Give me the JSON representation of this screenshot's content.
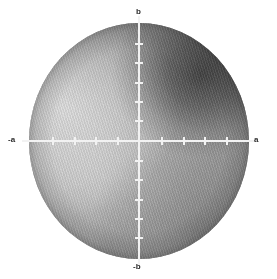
{
  "figure": {
    "kind": "grayscale-circular-intensity-map",
    "background_color": "#ffffff",
    "axis_color": "#f2f2f2",
    "label_color": "#2b2b2b"
  },
  "axes": {
    "horizontal": {
      "name": "a-axis",
      "label_positive": "a",
      "label_negative": "-a",
      "tick_count_per_side": 5
    },
    "vertical": {
      "name": "b-axis",
      "label_positive": "b",
      "label_negative": "-b",
      "tick_count_per_side": 6
    }
  },
  "chart_data": {
    "type": "heatmap",
    "title": "",
    "xlabel": "a",
    "ylabel": "b",
    "xlim": [
      -1,
      1
    ],
    "ylim": [
      -1,
      1
    ],
    "grid": false,
    "legend": null,
    "aperture": "circular",
    "colormap": "grayscale",
    "value_range_gray": [
      "#2a2a2a",
      "#e2e2e2"
    ],
    "x_ticks": [
      -1.0,
      -0.8,
      -0.6,
      -0.4,
      -0.2,
      0.2,
      0.4,
      0.6,
      0.8,
      1.0
    ],
    "y_ticks": [
      -1.0,
      -0.833,
      -0.667,
      -0.5,
      -0.333,
      -0.167,
      0.167,
      0.333,
      0.5,
      0.667,
      0.833,
      1.0
    ],
    "x_tick_labels": [
      "-a",
      "",
      "",
      "",
      "",
      "",
      "",
      "",
      "",
      "a"
    ],
    "y_tick_labels": [
      "-b",
      "",
      "",
      "",
      "",
      "",
      "",
      "",
      "",
      "",
      "",
      "b"
    ],
    "annotations": [
      {
        "text": "a",
        "x": 1.0,
        "y": 0.0
      },
      {
        "text": "-a",
        "x": -1.0,
        "y": 0.0
      },
      {
        "text": "b",
        "x": 0.0,
        "y": 1.0
      },
      {
        "text": "-b",
        "x": 0.0,
        "y": -1.0
      }
    ],
    "features": [
      {
        "name": "bright-lobe",
        "center_x": -0.62,
        "center_y": 0.28,
        "relative_intensity": 0.92
      },
      {
        "name": "dark-lobe",
        "center_x": 0.56,
        "center_y": 0.6,
        "relative_intensity": 0.12
      },
      {
        "name": "dark-lobe-lower-right",
        "center_x": 0.52,
        "center_y": -0.76,
        "relative_intensity": 0.34
      },
      {
        "name": "dark-lobe-lower-left",
        "center_x": -0.28,
        "center_y": -0.92,
        "relative_intensity": 0.4
      }
    ],
    "texture": {
      "name": "diagonal-interference-fringes",
      "orientation_deg": 72,
      "period_px": 2.4
    }
  }
}
